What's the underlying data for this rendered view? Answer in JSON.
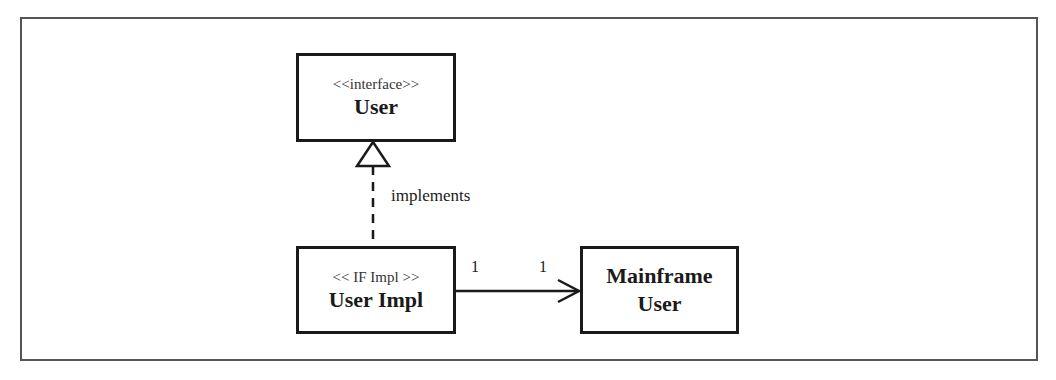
{
  "diagram": {
    "type": "uml-class-diagram",
    "classes": [
      {
        "id": "user",
        "stereotype": "<<interface>>",
        "name": "User"
      },
      {
        "id": "user-impl",
        "stereotype": "<< IF Impl >>",
        "name": "User Impl"
      },
      {
        "id": "mainframe-user",
        "stereotype": "",
        "name_lines": [
          "Mainframe",
          "User"
        ]
      }
    ],
    "relationships": [
      {
        "from": "user-impl",
        "to": "user",
        "kind": "realization",
        "line_style": "dashed",
        "arrowhead": "hollow-triangle",
        "label": "implements"
      },
      {
        "from": "user-impl",
        "to": "mainframe-user",
        "kind": "directed-association",
        "line_style": "solid",
        "arrowhead": "open",
        "source_multiplicity": "1",
        "target_multiplicity": "1"
      }
    ]
  },
  "colors": {
    "line": "#1a1a1a",
    "frame": "#555555",
    "background": "#ffffff"
  }
}
